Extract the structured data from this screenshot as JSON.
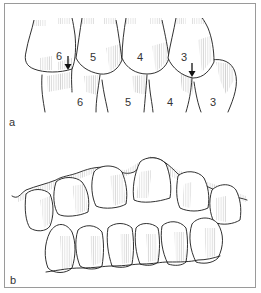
{
  "figure": {
    "panels": [
      {
        "id": "a",
        "label": "a",
        "description": "Lateral view of posterior teeth in occlusion",
        "upper_teeth": [
          {
            "number": "6"
          },
          {
            "number": "5"
          },
          {
            "number": "4"
          },
          {
            "number": "3"
          }
        ],
        "lower_teeth": [
          {
            "number": "6"
          },
          {
            "number": "5"
          },
          {
            "number": "4"
          },
          {
            "number": "3"
          }
        ],
        "arrows": [
          {
            "near_tooth": "6",
            "direction": "down"
          },
          {
            "near_tooth": "3",
            "direction": "down"
          }
        ]
      },
      {
        "id": "b",
        "label": "b",
        "description": "Frontal view of upper and lower anterior teeth"
      }
    ]
  }
}
